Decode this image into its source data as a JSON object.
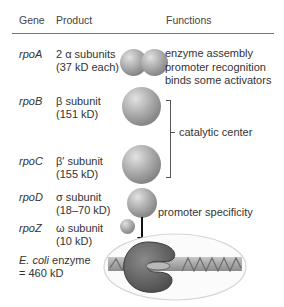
{
  "header": {
    "gene": "Gene",
    "product": "Product",
    "functions": "Functions"
  },
  "rows": [
    {
      "gene": "rpoA",
      "product_line1": "2 α subunits",
      "product_line2": "(37 kD each)",
      "functions": [
        "enzyme assembly",
        "promoter recognition",
        "binds some activators"
      ]
    },
    {
      "gene": "rpoB",
      "product_line1": "β subunit",
      "product_line2": "(151 kD)"
    },
    {
      "gene": "rpoC",
      "product_line1": "β′ subunit",
      "product_line2": "(155 kD)"
    },
    {
      "gene": "rpoD",
      "product_line1": "σ subunit",
      "product_line2": "(18–70 kD)",
      "function": "promoter specificity"
    },
    {
      "gene": "rpoZ",
      "product_line1": "ω subunit",
      "product_line2": "(10 kD)"
    }
  ],
  "shared_function": "catalytic center",
  "total": {
    "organism": "E. coli",
    "line1_rest": " enzyme",
    "line2": "= 460 kD"
  },
  "colors": {
    "subunit": "#9a9a9a",
    "enzyme": "#666666",
    "dna": "#b0b0b0",
    "ellipse_outline": "#d8d8d8"
  }
}
